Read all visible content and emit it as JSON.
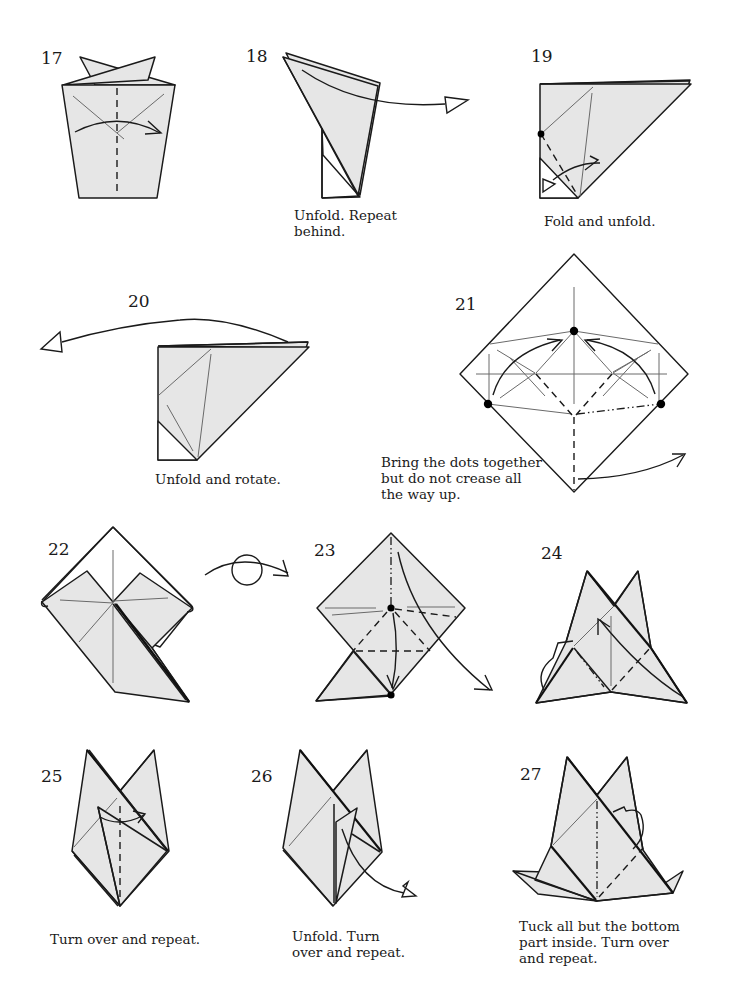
{
  "page": {
    "type": "origami instruction diagram page",
    "background": "#ffffff",
    "paper_color": "#e6e6e6",
    "line_color": "#1a1a1a"
  },
  "steps": [
    {
      "number": "17",
      "caption": "",
      "symbols": [
        "valley-fold-line",
        "fold-arrow",
        "crease-lines"
      ]
    },
    {
      "number": "18",
      "caption": "Unfold. Repeat\nbehind.",
      "symbols": [
        "unfold-arrow"
      ]
    },
    {
      "number": "19",
      "caption": "Fold and unfold.",
      "symbols": [
        "reference-dot",
        "valley-fold-line",
        "fold-and-unfold-arrow"
      ]
    },
    {
      "number": "20",
      "caption": "Unfold and rotate.",
      "symbols": [
        "unfold-arrow"
      ]
    },
    {
      "number": "21",
      "caption": "Bring the dots together\nbut do not crease all\nthe way up.",
      "symbols": [
        "reference-dot",
        "reference-dot",
        "reference-dot",
        "fold-arrow",
        "fold-arrow",
        "valley-fold-line",
        "mountain-fold-line",
        "fold-arrow"
      ]
    },
    {
      "number": "22",
      "caption": "",
      "symbols": [
        "turn-over-symbol"
      ]
    },
    {
      "number": "23",
      "caption": "",
      "symbols": [
        "reference-dot",
        "reference-dot",
        "valley-fold-line",
        "mountain-fold-line",
        "fold-arrow",
        "fold-arrow"
      ]
    },
    {
      "number": "24",
      "caption": "",
      "symbols": [
        "valley-fold-line",
        "fold-arrow",
        "fold-arrow"
      ]
    },
    {
      "number": "25",
      "caption": "Turn over and repeat.",
      "symbols": [
        "valley-fold-line",
        "fold-arrow"
      ]
    },
    {
      "number": "26",
      "caption": "Unfold. Turn\nover and repeat.",
      "symbols": [
        "unfold-arrow"
      ]
    },
    {
      "number": "27",
      "caption": "Tuck all but the bottom\npart inside. Turn over\nand repeat.",
      "symbols": [
        "mountain-fold-line",
        "valley-fold-line",
        "tuck-arrow"
      ]
    }
  ]
}
